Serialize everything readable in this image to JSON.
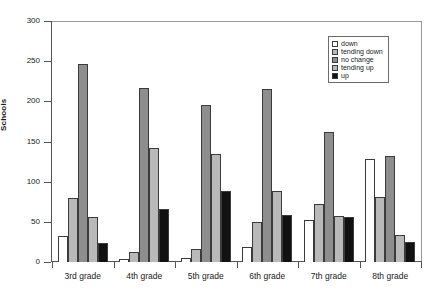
{
  "chart_data": {
    "type": "bar",
    "title": "",
    "xlabel": "",
    "ylabel": "Schools",
    "ylim": [
      0,
      300
    ],
    "yticks": [
      0,
      50,
      100,
      150,
      200,
      250,
      300
    ],
    "grid": false,
    "legend_position": "top-right",
    "categories": [
      "3rd grade",
      "4th grade",
      "5th grade",
      "6th grade",
      "7th grade",
      "8th grade"
    ],
    "series": [
      {
        "name": "down",
        "color": "#ffffff",
        "values": [
          32,
          4,
          5,
          19,
          52,
          128
        ]
      },
      {
        "name": "tending down",
        "color": "#b9b9b9",
        "values": [
          80,
          13,
          16,
          50,
          72,
          81
        ]
      },
      {
        "name": "no change",
        "color": "#8e8e8e",
        "values": [
          246,
          217,
          195,
          215,
          162,
          132
        ]
      },
      {
        "name": "tending up",
        "color": "#b9b9b9",
        "values": [
          56,
          142,
          135,
          88,
          57,
          34
        ]
      },
      {
        "name": "up",
        "color": "#111111",
        "values": [
          24,
          66,
          89,
          59,
          56,
          25
        ]
      }
    ]
  },
  "axis": {
    "y_title": "Schools",
    "y_tick_labels": [
      "300",
      "250",
      "200",
      "150",
      "100",
      "50",
      "0"
    ],
    "x_tick_labels": [
      "3rd grade",
      "4th grade",
      "5th grade",
      "6th grade",
      "7th grade",
      "8th grade"
    ]
  },
  "legend": {
    "items": [
      {
        "label": "down"
      },
      {
        "label": "tending down"
      },
      {
        "label": "no change"
      },
      {
        "label": "tending up"
      },
      {
        "label": "up"
      }
    ]
  }
}
